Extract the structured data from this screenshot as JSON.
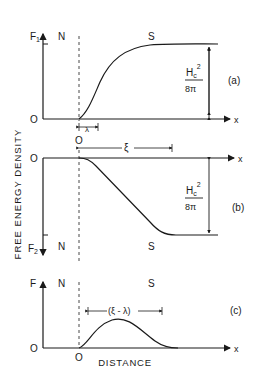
{
  "figure": {
    "y_axis_title": "FREE ENERGY DENSITY",
    "x_axis_title": "DISTANCE",
    "colors": {
      "ink": "#1a1a1a",
      "background": "#ffffff"
    }
  },
  "panels": [
    {
      "id": "a",
      "label": "(a)",
      "y_axis_label": "F",
      "y_axis_sub": "1",
      "origin_y_label": "O",
      "origin_x_label": "O",
      "x_axis_label": "x",
      "region_left": "N",
      "region_right": "S",
      "span_label": "λ",
      "height_label_num": "H",
      "height_label_sub": "c",
      "height_label_sup": "2",
      "height_label_den": "8π"
    },
    {
      "id": "b",
      "label": "(b)",
      "y_axis_label": "F",
      "y_axis_sub": "2",
      "origin_y_label": "O",
      "x_axis_label": "x",
      "region_left": "N",
      "region_right": "S",
      "span_label": "ξ",
      "height_label_num": "H",
      "height_label_sub": "c",
      "height_label_sup": "2",
      "height_label_den": "8π"
    },
    {
      "id": "c",
      "label": "(c)",
      "y_axis_label": "F",
      "origin_y_label": "O",
      "origin_x_label": "O",
      "x_axis_label": "x",
      "region_left": "N",
      "region_right": "S",
      "span_label": "(ξ - λ)"
    }
  ]
}
